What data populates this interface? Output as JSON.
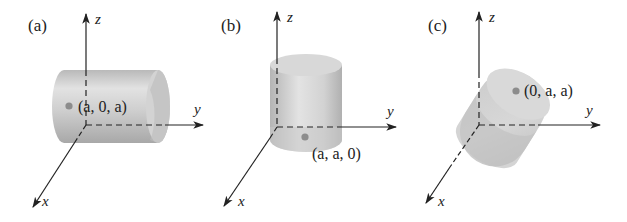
{
  "figure": {
    "panels": [
      {
        "id": "a",
        "label": "(a)",
        "axes": {
          "x": "x",
          "y": "y",
          "z": "z"
        },
        "cylinder_orientation": "parallel to y-axis",
        "point": {
          "label": "(a, 0, a)",
          "coords": [
            "a",
            "0",
            "a"
          ]
        }
      },
      {
        "id": "b",
        "label": "(b)",
        "axes": {
          "x": "x",
          "y": "y",
          "z": "z"
        },
        "cylinder_orientation": "parallel to z-axis",
        "point": {
          "label": "(a, a, 0)",
          "coords": [
            "a",
            "a",
            "0"
          ]
        }
      },
      {
        "id": "c",
        "label": "(c)",
        "axes": {
          "x": "x",
          "y": "y",
          "z": "z"
        },
        "cylinder_orientation": "parallel to x-axis",
        "point": {
          "label": "(0, a, a)",
          "coords": [
            "0",
            "a",
            "a"
          ]
        }
      }
    ],
    "colors": {
      "axis": "#222222",
      "cylinder_light": "#e4e4e4",
      "cylinder_mid": "#c8c8c8",
      "cylinder_dark": "#a9a9a9",
      "point": "#8c8c8c"
    }
  }
}
